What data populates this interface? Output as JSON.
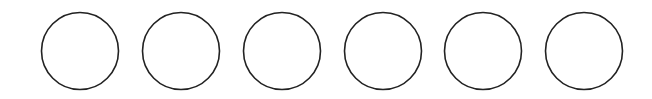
{
  "canvas": {
    "width": 652,
    "height": 99,
    "background": "#ffffff"
  },
  "style": {
    "stroke": "#222222",
    "stroke_width": 1.6,
    "fill": "none"
  },
  "circles": [
    {
      "id": "circle-1",
      "cx": 80,
      "cy": 51,
      "r": 38.5
    },
    {
      "id": "circle-2",
      "cx": 181,
      "cy": 51,
      "r": 38.5
    },
    {
      "id": "circle-3",
      "cx": 282,
      "cy": 51,
      "r": 38.5
    },
    {
      "id": "circle-4",
      "cx": 383,
      "cy": 51,
      "r": 38.5
    },
    {
      "id": "circle-5",
      "cx": 483,
      "cy": 51,
      "r": 38.5
    },
    {
      "id": "circle-6",
      "cx": 584,
      "cy": 51,
      "r": 38.5
    }
  ]
}
